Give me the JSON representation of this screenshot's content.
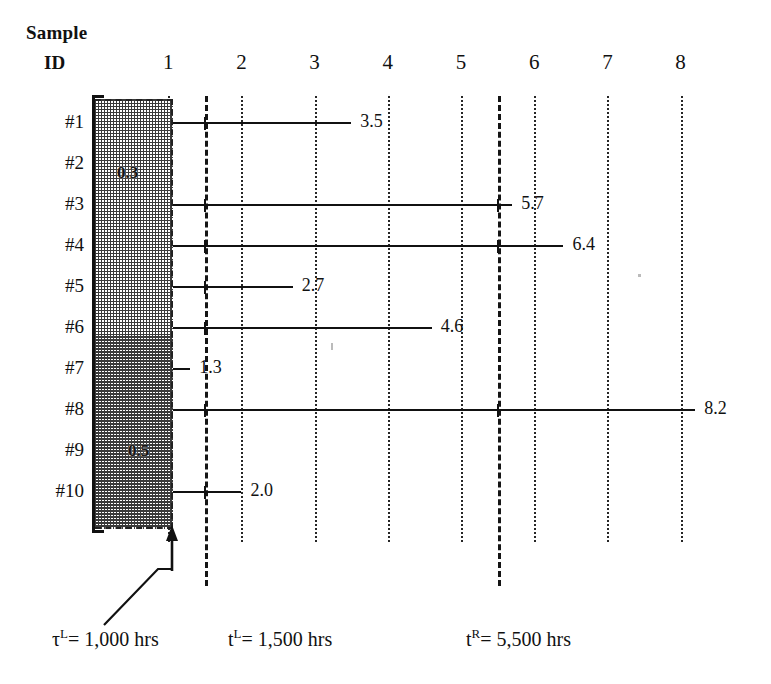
{
  "chart_data": {
    "type": "bar",
    "title": "",
    "subtitle": "",
    "xlabel": "",
    "ylabel": "Sample ID",
    "xlim": [
      0,
      8.5
    ],
    "grid": true,
    "legend_position": "none",
    "axis_header": {
      "line1": "Sample",
      "line2": "ID"
    },
    "x_ticks": [
      1,
      2,
      3,
      4,
      5,
      6,
      7,
      8
    ],
    "x_tick_labels": [
      "1",
      "2",
      "3",
      "4",
      "5",
      "6",
      "7",
      "8"
    ],
    "categories": [
      "#1",
      "#2",
      "#3",
      "#4",
      "#5",
      "#6",
      "#7",
      "#8",
      "#9",
      "#10"
    ],
    "values": [
      3.5,
      null,
      5.7,
      6.4,
      2.7,
      4.6,
      1.3,
      8.2,
      null,
      2.0
    ],
    "value_labels": [
      "3.5",
      "",
      "5.7",
      "6.4",
      "2.7",
      "4.6",
      "1.3",
      "8.2",
      "",
      "2.0"
    ],
    "censored_region": {
      "label": "left-censoring band",
      "x_start": 0,
      "x_end": 1.07,
      "hatched": true,
      "inner_labels": [
        {
          "text": "0.3",
          "row": "#2"
        },
        {
          "text": "0.5",
          "row": "#9"
        }
      ]
    },
    "reference_lines": [
      {
        "name": "tau-L",
        "x": 1.0,
        "style": "dashed",
        "label": "τ L = 1,000 hrs"
      },
      {
        "name": "t-L",
        "x": 1.5,
        "style": "dashed",
        "label": "t L = 1,500 hrs"
      },
      {
        "name": "t-R",
        "x": 5.5,
        "style": "dashed",
        "label": "t R = 5,500 hrs"
      }
    ]
  },
  "rows": [
    {
      "id": "#1",
      "value_label": "3.5",
      "value": 3.5
    },
    {
      "id": "#2",
      "value_label": "",
      "value": null
    },
    {
      "id": "#3",
      "value_label": "5.7",
      "value": 5.7
    },
    {
      "id": "#4",
      "value_label": "6.4",
      "value": 6.4
    },
    {
      "id": "#5",
      "value_label": "2.7",
      "value": 2.7
    },
    {
      "id": "#6",
      "value_label": "4.6",
      "value": 4.6
    },
    {
      "id": "#7",
      "value_label": "1.3",
      "value": 1.3
    },
    {
      "id": "#8",
      "value_label": "8.2",
      "value": 8.2
    },
    {
      "id": "#9",
      "value_label": "",
      "value": null
    },
    {
      "id": "#10",
      "value_label": "2.0",
      "value": 2.0
    }
  ],
  "ticks": [
    {
      "label": "1"
    },
    {
      "label": "2"
    },
    {
      "label": "3"
    },
    {
      "label": "4"
    },
    {
      "label": "5"
    },
    {
      "label": "6"
    },
    {
      "label": "7"
    },
    {
      "label": "8"
    }
  ],
  "censor_labels": {
    "upper": "0.3",
    "lower": "0.5"
  },
  "notes": {
    "tau_l": {
      "symbol": "τ",
      "sup": "L",
      "text": "= 1,000 hrs"
    },
    "t_l": {
      "symbol": "t",
      "sup": "L",
      "text": "= 1,500 hrs"
    },
    "t_r": {
      "symbol": "t",
      "sup": "R",
      "text": "= 5,500 hrs"
    }
  },
  "colors": {
    "ink": "#111111",
    "hatch": "#3a3a3a",
    "background": "#ffffff"
  }
}
